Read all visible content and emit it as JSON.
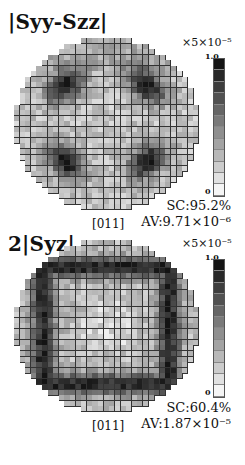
{
  "chart_data": [
    {
      "type": "heatmap",
      "title": "|Syy-Szz|",
      "scale_factor": "×5×10⁻⁵",
      "colorbar": {
        "min_label": "0",
        "max_label": "1.0",
        "range": [
          0,
          1.0
        ],
        "colormap": "gray_r"
      },
      "xlabel": "[011]",
      "annotations": [
        "SC:95.2%",
        "AV:9.71×10⁻⁶"
      ],
      "grid": {
        "cols": 33,
        "rows": 31,
        "shape": "disc"
      },
      "pattern": "ring with four dark lobes at upper-left, upper-right, lower-left, lower-right; lighter center"
    },
    {
      "type": "heatmap",
      "title": "2|Syz|",
      "scale_factor": "×5×10⁻⁵",
      "colorbar": {
        "min_label": "0",
        "max_label": "1.0",
        "range": [
          0,
          1.0
        ],
        "colormap": "gray_r"
      },
      "xlabel": "[011]",
      "annotations": [
        "SC:60.4%",
        "AV:1.87×10⁻⁵"
      ],
      "grid": {
        "cols": 33,
        "rows": 31,
        "shape": "disc"
      },
      "pattern": "dark square frame with dark bands at top, bottom, left, right; lighter center"
    }
  ],
  "panels": [
    {
      "title": "|Syy-Szz|",
      "scale": "×5×10⁻⁵",
      "cbar_max": "1.0",
      "cbar_min": "0",
      "sc": "SC:95.2%",
      "av": "AV:9.71×10⁻⁶",
      "axis": "[011]"
    },
    {
      "title": "2|Syz|",
      "scale": "×5×10⁻⁵",
      "cbar_max": "1.0",
      "cbar_min": "0",
      "sc": "SC:60.4%",
      "av": "AV:1.87×10⁻⁵",
      "axis": "[011]"
    }
  ]
}
